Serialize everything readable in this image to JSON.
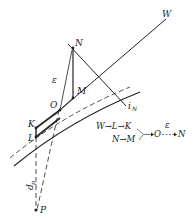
{
  "diagram": {
    "title": "",
    "colors": {
      "line": "#222222",
      "background": "#ffffff"
    },
    "points": {
      "N": {
        "label": "N"
      },
      "M": {
        "label": "M"
      },
      "O": {
        "label": "O"
      },
      "K": {
        "label": "K"
      },
      "L": {
        "label": "L"
      },
      "P": {
        "label": "P"
      },
      "W": {
        "label": "W"
      },
      "iN": {
        "label": "i",
        "sub": "N"
      }
    },
    "annotations": {
      "epsilon": "ε",
      "dp_main": "d",
      "dp_sub": "p"
    },
    "flow": {
      "row1": [
        "W",
        "→",
        "L",
        "→",
        "K"
      ],
      "row2": [
        "N",
        "→",
        "M"
      ],
      "merge_target": "O",
      "epsilon": "ε",
      "end": "N",
      "row1_text": "W→L→K",
      "row2_text": "N→M",
      "o_label": "O",
      "end_label": "N",
      "eps_label": "ε"
    }
  }
}
